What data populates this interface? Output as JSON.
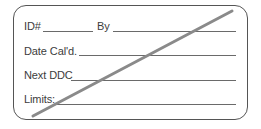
{
  "label": {
    "type": "calibration-label",
    "status": "voided",
    "strike_color": "#8a8a8a",
    "border_color": "#555555",
    "fields": [
      {
        "id": "id",
        "label": "ID#",
        "value": ""
      },
      {
        "id": "by",
        "label": "By",
        "value": ""
      },
      {
        "id": "date_cald",
        "label": "Date Cal'd.",
        "value": ""
      },
      {
        "id": "next_ddc",
        "label": "Next DDC",
        "value": ""
      },
      {
        "id": "limits",
        "label": "Limits:",
        "value": ""
      }
    ]
  }
}
